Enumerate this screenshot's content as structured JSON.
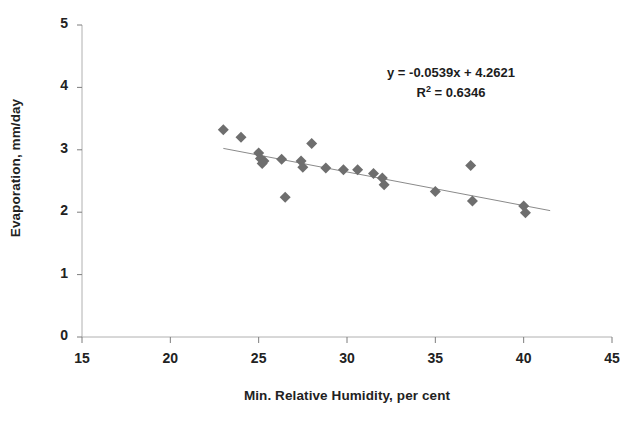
{
  "chart_data": {
    "type": "scatter",
    "title": "",
    "xlabel": "Min. Relative Humidity, per cent",
    "ylabel": "Evaporation, mm/day",
    "xlim": [
      15,
      45
    ],
    "ylim": [
      0,
      5
    ],
    "xticks": [
      15,
      20,
      25,
      30,
      35,
      40,
      45
    ],
    "yticks": [
      0,
      1,
      2,
      3,
      4,
      5
    ],
    "xtick_labels": [
      "15",
      "20",
      "25",
      "30",
      "35",
      "40",
      "45"
    ],
    "ytick_labels": [
      "0",
      "1",
      "2",
      "3",
      "4",
      "5"
    ],
    "grid": false,
    "legend": false,
    "marker": "diamond",
    "marker_color": "#6e6e6e",
    "marker_size": 11,
    "points": [
      {
        "x": 23.0,
        "y": 3.32
      },
      {
        "x": 24.0,
        "y": 3.2
      },
      {
        "x": 25.0,
        "y": 2.95
      },
      {
        "x": 25.1,
        "y": 2.86
      },
      {
        "x": 25.2,
        "y": 2.78
      },
      {
        "x": 25.3,
        "y": 2.82
      },
      {
        "x": 26.3,
        "y": 2.85
      },
      {
        "x": 26.5,
        "y": 2.24
      },
      {
        "x": 27.4,
        "y": 2.82
      },
      {
        "x": 27.5,
        "y": 2.72
      },
      {
        "x": 28.0,
        "y": 3.1
      },
      {
        "x": 28.8,
        "y": 2.71
      },
      {
        "x": 29.8,
        "y": 2.68
      },
      {
        "x": 30.6,
        "y": 2.68
      },
      {
        "x": 31.5,
        "y": 2.62
      },
      {
        "x": 32.0,
        "y": 2.55
      },
      {
        "x": 32.1,
        "y": 2.44
      },
      {
        "x": 35.0,
        "y": 2.33
      },
      {
        "x": 37.0,
        "y": 2.75
      },
      {
        "x": 37.1,
        "y": 2.18
      },
      {
        "x": 40.0,
        "y": 2.1
      },
      {
        "x": 40.1,
        "y": 1.99
      }
    ],
    "trendline": {
      "type": "linear",
      "slope": -0.0539,
      "intercept": 4.2621,
      "x_start": 23.0,
      "x_end": 41.5,
      "color": "#8a8a8a"
    },
    "annotations": {
      "equation": "y = -0.0539x + 4.2621",
      "r_squared_prefix": "R",
      "r_squared_exponent": "2",
      "r_squared_value": " = 0.6346",
      "r_squared_full": "R2 = 0.6346"
    }
  },
  "axes": {
    "x_title": "Min. Relative Humidity, per cent",
    "y_title": "Evaporation, mm/day"
  },
  "colors": {
    "marker": "#6e6e6e",
    "trendline": "#8a8a8a",
    "axis": "#9a9a9a",
    "text": "#1c1c1c"
  }
}
